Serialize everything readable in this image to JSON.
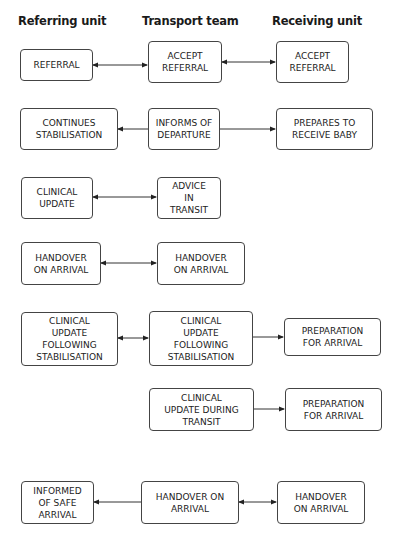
{
  "headers": {
    "referring": "Referring unit",
    "transport": "Transport team",
    "receiving": "Receiving unit"
  },
  "rows": [
    {
      "referring": "REFERRAL",
      "transport": "ACCEPT\nREFERRAL",
      "receiving": "ACCEPT\nREFERRAL",
      "arrows": [
        "referring<->transport",
        "transport<->receiving"
      ]
    },
    {
      "referring": "CONTINUES\nSTABILISATION",
      "transport": "INFORMS OF\nDEPARTURE",
      "receiving": "PREPARES TO\nRECEIVE BABY",
      "arrows": [
        "transport->referring",
        "transport->receiving"
      ]
    },
    {
      "referring": "CLINICAL\nUPDATE",
      "transport": "ADVICE\nIN\nTRANSIT",
      "arrows": [
        "referring<->transport"
      ]
    },
    {
      "referring": "HANDOVER\nON ARRIVAL",
      "transport": "HANDOVER\nON ARRIVAL",
      "arrows": [
        "referring<->transport"
      ]
    },
    {
      "referring": "CLINICAL\nUPDATE\nFOLLOWING\nSTABILISATION",
      "transport": "CLINICAL\nUPDATE\nFOLLOWING\nSTABILISATION",
      "receiving": "PREPARATION\nFOR ARRIVAL",
      "arrows": [
        "referring<->transport",
        "transport->receiving"
      ]
    },
    {
      "transport": "CLINICAL\nUPDATE DURING\nTRANSIT",
      "receiving": "PREPARATION\nFOR ARRIVAL",
      "arrows": [
        "transport->receiving"
      ]
    },
    {
      "referring": "INFORMED\nOF SAFE\nARRIVAL",
      "transport": "HANDOVER ON\nARRIVAL",
      "receiving": "HANDOVER\nON ARRIVAL",
      "arrows": [
        "transport->referring",
        "transport<->receiving"
      ]
    }
  ]
}
